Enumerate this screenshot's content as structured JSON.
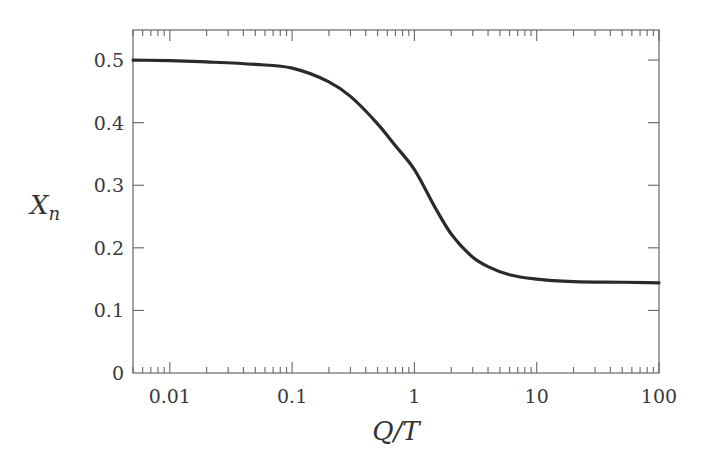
{
  "chart_data": {
    "type": "line",
    "title": "",
    "xlabel": "Q/T",
    "ylabel": "X_n",
    "ylabel_main": "X",
    "ylabel_sub": "n",
    "xscale": "log",
    "xlim": [
      0.005,
      100
    ],
    "ylim": [
      0,
      0.548
    ],
    "grid": false,
    "legend": null,
    "x_ticks": [
      {
        "value": 0.01,
        "label": "0.01"
      },
      {
        "value": 0.1,
        "label": "0.1"
      },
      {
        "value": 1,
        "label": "1"
      },
      {
        "value": 10,
        "label": "10"
      },
      {
        "value": 100,
        "label": "100"
      }
    ],
    "y_ticks": [
      {
        "value": 0,
        "label": "0"
      },
      {
        "value": 0.1,
        "label": "0.1"
      },
      {
        "value": 0.2,
        "label": "0.2"
      },
      {
        "value": 0.3,
        "label": "0.3"
      },
      {
        "value": 0.4,
        "label": "0.4"
      },
      {
        "value": 0.5,
        "label": "0.5"
      }
    ],
    "series": [
      {
        "name": "X_n",
        "color": "#2a2a2a",
        "x": [
          0.005,
          0.01,
          0.02,
          0.05,
          0.1,
          0.2,
          0.3,
          0.5,
          0.7,
          1,
          1.5,
          2,
          3,
          4,
          6,
          10,
          20,
          50,
          100
        ],
        "y": [
          0.5,
          0.499,
          0.497,
          0.493,
          0.487,
          0.465,
          0.442,
          0.398,
          0.363,
          0.325,
          0.262,
          0.222,
          0.185,
          0.17,
          0.157,
          0.15,
          0.146,
          0.145,
          0.144
        ]
      }
    ]
  },
  "colors": {
    "background": "#ffffff",
    "axes": "#555555",
    "curve": "#2a2a2a"
  }
}
